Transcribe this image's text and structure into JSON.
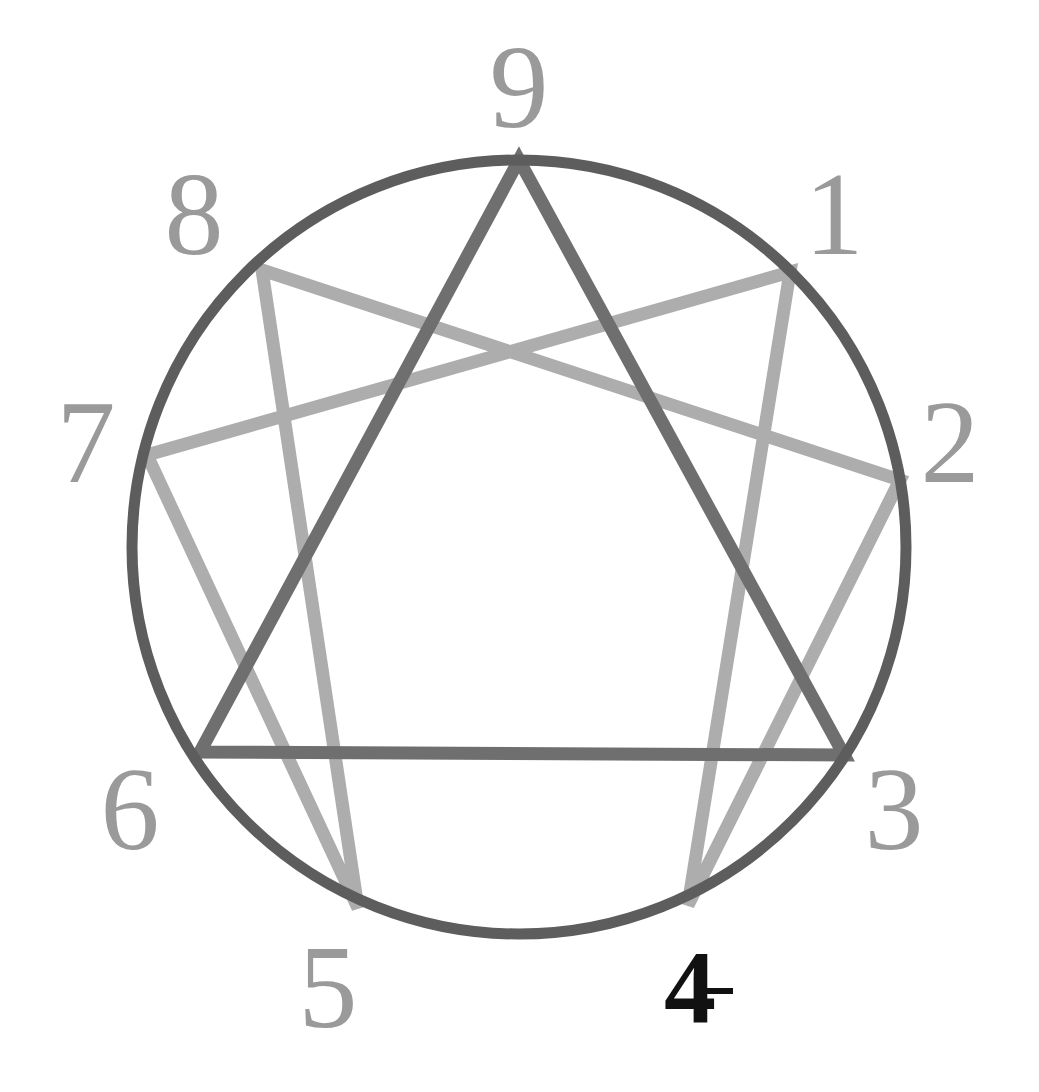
{
  "figure": {
    "type": "enneagram-diagram",
    "background_color": "#ffffff",
    "canvas": {
      "width": 1039,
      "height": 1092
    },
    "circle": {
      "name": "enneagram-circle",
      "center_x": 519,
      "center_y": 547,
      "radius": 387,
      "stroke_color": "#5d5d5d",
      "stroke_width": 11
    },
    "triangle": {
      "name": "triangle-9-3-6",
      "points": [
        9,
        3,
        6
      ],
      "stroke_color": "#6f6f6f",
      "stroke_width": 13
    },
    "hexad": {
      "name": "hexad-1-4-2-8-5-7",
      "points": [
        1,
        4,
        2,
        8,
        5,
        7
      ],
      "stroke_color": "#adadad",
      "stroke_width": 13
    },
    "points": [
      {
        "id": 9,
        "label": "9",
        "angle_deg": -90,
        "x": 519,
        "y": 160,
        "label_x": 519,
        "label_y": 88,
        "color": "#9a9a9a",
        "emphasis": "normal"
      },
      {
        "id": 1,
        "label": "1",
        "angle_deg": -50,
        "x": 790,
        "y": 272,
        "label_x": 834,
        "label_y": 215,
        "color": "#9a9a9a",
        "emphasis": "normal"
      },
      {
        "id": 2,
        "label": "2",
        "angle_deg": -10,
        "x": 900,
        "y": 480,
        "label_x": 950,
        "label_y": 443,
        "color": "#9a9a9a",
        "emphasis": "normal"
      },
      {
        "id": 3,
        "label": "3",
        "angle_deg": 30,
        "x": 844,
        "y": 755,
        "label_x": 894,
        "label_y": 810,
        "color": "#9a9a9a",
        "emphasis": "normal"
      },
      {
        "id": 4,
        "label": "4",
        "angle_deg": 70,
        "x": 688,
        "y": 905,
        "label_x": 690,
        "label_y": 987,
        "color": "#111111",
        "emphasis": "bold"
      },
      {
        "id": 5,
        "label": "5",
        "angle_deg": 110,
        "x": 358,
        "y": 908,
        "label_x": 328,
        "label_y": 988,
        "color": "#9a9a9a",
        "emphasis": "normal"
      },
      {
        "id": 6,
        "label": "6",
        "angle_deg": 150,
        "x": 200,
        "y": 752,
        "label_x": 130,
        "label_y": 810,
        "color": "#9a9a9a",
        "emphasis": "normal"
      },
      {
        "id": 7,
        "label": "7",
        "angle_deg": 190,
        "x": 147,
        "y": 455,
        "label_x": 86,
        "label_y": 443,
        "color": "#9a9a9a",
        "emphasis": "normal"
      },
      {
        "id": 8,
        "label": "8",
        "angle_deg": -130,
        "x": 262,
        "y": 270,
        "label_x": 194,
        "label_y": 215,
        "color": "#9a9a9a",
        "emphasis": "normal"
      }
    ],
    "triangle_edges": [
      {
        "from": 9,
        "to": 3
      },
      {
        "from": 3,
        "to": 6
      },
      {
        "from": 6,
        "to": 9
      }
    ],
    "hexad_edges": [
      {
        "from": 1,
        "to": 4
      },
      {
        "from": 4,
        "to": 2
      },
      {
        "from": 2,
        "to": 8
      },
      {
        "from": 8,
        "to": 5
      },
      {
        "from": 5,
        "to": 7
      },
      {
        "from": 7,
        "to": 1
      }
    ],
    "artifact": {
      "name": "stray-tick-mark",
      "x": 706,
      "y": 988,
      "width": 27,
      "height": 6,
      "color": "#111111"
    }
  }
}
